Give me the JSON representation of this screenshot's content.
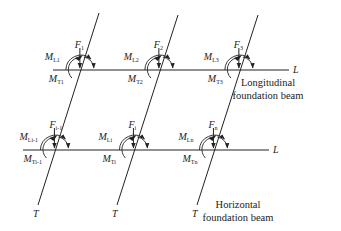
{
  "diagram": {
    "type": "structural-force-diagram",
    "beams": {
      "longitudinal_axis_label": "L",
      "transverse_axis_label": "T",
      "longitudinal_caption_lines": [
        "Longitudinal",
        "foundation beam"
      ],
      "horizontal_caption_lines": [
        "Horizontal",
        "foundation beam"
      ]
    },
    "top_row": [
      {
        "force": {
          "base": "F",
          "sub": "1"
        },
        "ml": {
          "base": "M",
          "sub": "L1"
        },
        "mt": {
          "base": "M",
          "sub": "T1"
        }
      },
      {
        "force": {
          "base": "F",
          "sub": "2"
        },
        "ml": {
          "base": "M",
          "sub": "L2"
        },
        "mt": {
          "base": "M",
          "sub": "T2"
        }
      },
      {
        "force": {
          "base": "F",
          "sub": "3"
        },
        "ml": {
          "base": "M",
          "sub": "L3"
        },
        "mt": {
          "base": "M",
          "sub": "T3"
        }
      }
    ],
    "bottom_row": [
      {
        "force": {
          "base": "F",
          "sub": "i-1"
        },
        "ml": {
          "base": "M",
          "sub": "Li-1"
        },
        "mt": {
          "base": "M",
          "sub": "Ti-1"
        }
      },
      {
        "force": {
          "base": "F",
          "sub": "i"
        },
        "ml": {
          "base": "M",
          "sub": "Li"
        },
        "mt": {
          "base": "M",
          "sub": "Ti"
        }
      },
      {
        "force": {
          "base": "F",
          "sub": "n"
        },
        "ml": {
          "base": "M",
          "sub": "Ln"
        },
        "mt": {
          "base": "M",
          "sub": "Tn"
        }
      }
    ],
    "colors": {
      "ink": "#222222",
      "background": "#ffffff"
    }
  }
}
